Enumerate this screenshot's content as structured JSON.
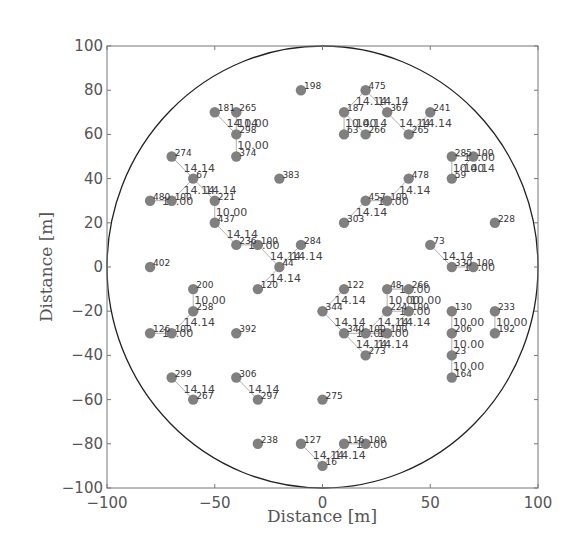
{
  "chart_data": {
    "type": "scatter",
    "title": "",
    "xlabel": "Distance [m]",
    "ylabel": "Distance [m]",
    "xlim": [
      -100,
      100
    ],
    "ylim": [
      -100,
      100
    ],
    "grid": false,
    "legend": null,
    "xticks": [
      -100,
      -50,
      0,
      50,
      100
    ],
    "yticks": [
      -100,
      -80,
      -60,
      -40,
      -20,
      0,
      20,
      40,
      60,
      80,
      100
    ],
    "xtick_labels": [
      "−100",
      "−50",
      "0",
      "50",
      "100"
    ],
    "ytick_labels": [
      "−100",
      "−80",
      "−60",
      "−40",
      "−20",
      "0",
      "20",
      "40",
      "60",
      "80",
      "100"
    ],
    "boundary_circle": {
      "cx": 0,
      "cy": 0,
      "r": 100
    },
    "colors": {
      "node": "#808080",
      "edge": "#9a9a9a",
      "circle": "#222222",
      "axes": "#777777"
    },
    "nodes": [
      {
        "x": -10,
        "y": 80,
        "label": "198"
      },
      {
        "x": 20,
        "y": 80,
        "label": "475"
      },
      {
        "x": -50,
        "y": 70,
        "label": "181"
      },
      {
        "x": -40,
        "y": 70,
        "label": "265"
      },
      {
        "x": -40,
        "y": 60,
        "label": "298"
      },
      {
        "x": -40,
        "y": 50,
        "label": "374"
      },
      {
        "x": 10,
        "y": 70,
        "label": "187"
      },
      {
        "x": 30,
        "y": 70,
        "label": "367"
      },
      {
        "x": 50,
        "y": 70,
        "label": "241"
      },
      {
        "x": 10,
        "y": 60,
        "label": "63"
      },
      {
        "x": 20,
        "y": 60,
        "label": "266"
      },
      {
        "x": 40,
        "y": 60,
        "label": "265"
      },
      {
        "x": -70,
        "y": 50,
        "label": "274"
      },
      {
        "x": -60,
        "y": 40,
        "label": "67"
      },
      {
        "x": -80,
        "y": 30,
        "label": "480"
      },
      {
        "x": -70,
        "y": 30,
        "label": "100"
      },
      {
        "x": -50,
        "y": 30,
        "label": "221"
      },
      {
        "x": -50,
        "y": 20,
        "label": "437"
      },
      {
        "x": -20,
        "y": 40,
        "label": "383"
      },
      {
        "x": 40,
        "y": 40,
        "label": "478"
      },
      {
        "x": 20,
        "y": 30,
        "label": "457"
      },
      {
        "x": 30,
        "y": 30,
        "label": "100"
      },
      {
        "x": 10,
        "y": 20,
        "label": "303"
      },
      {
        "x": 60,
        "y": 50,
        "label": "285"
      },
      {
        "x": 70,
        "y": 50,
        "label": "100"
      },
      {
        "x": 60,
        "y": 40,
        "label": "59"
      },
      {
        "x": 80,
        "y": 20,
        "label": "228"
      },
      {
        "x": -40,
        "y": 10,
        "label": "236"
      },
      {
        "x": -30,
        "y": 10,
        "label": "100"
      },
      {
        "x": -10,
        "y": 10,
        "label": "284"
      },
      {
        "x": -20,
        "y": 0,
        "label": "44"
      },
      {
        "x": -30,
        "y": -10,
        "label": "120"
      },
      {
        "x": -80,
        "y": 0,
        "label": "402"
      },
      {
        "x": 50,
        "y": 10,
        "label": "73"
      },
      {
        "x": 60,
        "y": 0,
        "label": "330"
      },
      {
        "x": 70,
        "y": 0,
        "label": "100"
      },
      {
        "x": -60,
        "y": -10,
        "label": "200"
      },
      {
        "x": -60,
        "y": -20,
        "label": "258"
      },
      {
        "x": -80,
        "y": -30,
        "label": "126"
      },
      {
        "x": -70,
        "y": -30,
        "label": "100"
      },
      {
        "x": -40,
        "y": -30,
        "label": "392"
      },
      {
        "x": 10,
        "y": -10,
        "label": "122"
      },
      {
        "x": 0,
        "y": -20,
        "label": "344"
      },
      {
        "x": 10,
        "y": -30,
        "label": "340"
      },
      {
        "x": 20,
        "y": -30,
        "label": "100"
      },
      {
        "x": 30,
        "y": -30,
        "label": "100"
      },
      {
        "x": 20,
        "y": -40,
        "label": "273"
      },
      {
        "x": 30,
        "y": -10,
        "label": "48"
      },
      {
        "x": 40,
        "y": -10,
        "label": "266"
      },
      {
        "x": 30,
        "y": -20,
        "label": "224"
      },
      {
        "x": 40,
        "y": -20,
        "label": "100"
      },
      {
        "x": 60,
        "y": -20,
        "label": "130"
      },
      {
        "x": 60,
        "y": -30,
        "label": "206"
      },
      {
        "x": 60,
        "y": -40,
        "label": "23"
      },
      {
        "x": 60,
        "y": -50,
        "label": "164"
      },
      {
        "x": 80,
        "y": -20,
        "label": "233"
      },
      {
        "x": 80,
        "y": -30,
        "label": "192"
      },
      {
        "x": -70,
        "y": -50,
        "label": "299"
      },
      {
        "x": -60,
        "y": -60,
        "label": "267"
      },
      {
        "x": -40,
        "y": -50,
        "label": "306"
      },
      {
        "x": -30,
        "y": -60,
        "label": "297"
      },
      {
        "x": 0,
        "y": -60,
        "label": "275"
      },
      {
        "x": -30,
        "y": -80,
        "label": "238"
      },
      {
        "x": -10,
        "y": -80,
        "label": "127"
      },
      {
        "x": 10,
        "y": -80,
        "label": "116"
      },
      {
        "x": 20,
        "y": -80,
        "label": "100"
      },
      {
        "x": 0,
        "y": -90,
        "label": "16"
      }
    ],
    "edges": [
      {
        "from": [
          -50,
          70
        ],
        "to": [
          -40,
          60
        ],
        "label": "14.14"
      },
      {
        "from": [
          -40,
          70
        ],
        "to": [
          -40,
          60
        ],
        "label": "10.00"
      },
      {
        "from": [
          -40,
          60
        ],
        "to": [
          -40,
          50
        ],
        "label": "10.00"
      },
      {
        "from": [
          20,
          80
        ],
        "to": [
          10,
          70
        ],
        "label": "14.14"
      },
      {
        "from": [
          20,
          80
        ],
        "to": [
          30,
          70
        ],
        "label": "14.14"
      },
      {
        "from": [
          10,
          70
        ],
        "to": [
          10,
          60
        ],
        "label": "10.00"
      },
      {
        "from": [
          10,
          70
        ],
        "to": [
          20,
          60
        ],
        "label": "14.14"
      },
      {
        "from": [
          30,
          70
        ],
        "to": [
          40,
          60
        ],
        "label": "14.14"
      },
      {
        "from": [
          50,
          70
        ],
        "to": [
          40,
          60
        ],
        "label": "14.14"
      },
      {
        "from": [
          -70,
          50
        ],
        "to": [
          -60,
          40
        ],
        "label": "14.14"
      },
      {
        "from": [
          -60,
          40
        ],
        "to": [
          -70,
          30
        ],
        "label": "14.14"
      },
      {
        "from": [
          -60,
          40
        ],
        "to": [
          -50,
          30
        ],
        "label": "14.14"
      },
      {
        "from": [
          -80,
          30
        ],
        "to": [
          -70,
          30
        ],
        "label": "10.00"
      },
      {
        "from": [
          -50,
          30
        ],
        "to": [
          -50,
          20
        ],
        "label": "10.00"
      },
      {
        "from": [
          -50,
          20
        ],
        "to": [
          -40,
          10
        ],
        "label": "14.14"
      },
      {
        "from": [
          -40,
          10
        ],
        "to": [
          -30,
          10
        ],
        "label": "10.00"
      },
      {
        "from": [
          -30,
          10
        ],
        "to": [
          -20,
          0
        ],
        "label": "14.14"
      },
      {
        "from": [
          -10,
          10
        ],
        "to": [
          -20,
          0
        ],
        "label": "14.14"
      },
      {
        "from": [
          -20,
          0
        ],
        "to": [
          -30,
          -10
        ],
        "label": "14.14"
      },
      {
        "from": [
          40,
          40
        ],
        "to": [
          30,
          30
        ],
        "label": "14.14"
      },
      {
        "from": [
          20,
          30
        ],
        "to": [
          30,
          30
        ],
        "label": "10.00"
      },
      {
        "from": [
          20,
          30
        ],
        "to": [
          10,
          20
        ],
        "label": "14.14"
      },
      {
        "from": [
          60,
          50
        ],
        "to": [
          70,
          50
        ],
        "label": "10.00"
      },
      {
        "from": [
          60,
          50
        ],
        "to": [
          60,
          40
        ],
        "label": "10.00"
      },
      {
        "from": [
          70,
          50
        ],
        "to": [
          60,
          40
        ],
        "label": "14.14"
      },
      {
        "from": [
          50,
          10
        ],
        "to": [
          60,
          0
        ],
        "label": "14.14"
      },
      {
        "from": [
          60,
          0
        ],
        "to": [
          70,
          0
        ],
        "label": "10.00"
      },
      {
        "from": [
          -60,
          -10
        ],
        "to": [
          -60,
          -20
        ],
        "label": "10.00"
      },
      {
        "from": [
          -60,
          -20
        ],
        "to": [
          -70,
          -30
        ],
        "label": "14.14"
      },
      {
        "from": [
          -80,
          -30
        ],
        "to": [
          -70,
          -30
        ],
        "label": "10.00"
      },
      {
        "from": [
          10,
          -10
        ],
        "to": [
          0,
          -20
        ],
        "label": "14.14"
      },
      {
        "from": [
          0,
          -20
        ],
        "to": [
          10,
          -30
        ],
        "label": "14.14"
      },
      {
        "from": [
          10,
          -30
        ],
        "to": [
          20,
          -40
        ],
        "label": "14.14"
      },
      {
        "from": [
          10,
          -30
        ],
        "to": [
          20,
          -30
        ],
        "label": "10.00"
      },
      {
        "from": [
          20,
          -30
        ],
        "to": [
          30,
          -30
        ],
        "label": "10.00"
      },
      {
        "from": [
          30,
          -20
        ],
        "to": [
          20,
          -30
        ],
        "label": "14.14"
      },
      {
        "from": [
          30,
          -10
        ],
        "to": [
          30,
          -20
        ],
        "label": "10.00"
      },
      {
        "from": [
          30,
          -10
        ],
        "to": [
          40,
          -10
        ],
        "label": "10.00"
      },
      {
        "from": [
          40,
          -10
        ],
        "to": [
          40,
          -20
        ],
        "label": "10.00"
      },
      {
        "from": [
          30,
          -20
        ],
        "to": [
          40,
          -20
        ],
        "label": "10.00"
      },
      {
        "from": [
          40,
          -20
        ],
        "to": [
          30,
          -30
        ],
        "label": "14.14"
      },
      {
        "from": [
          30,
          -30
        ],
        "to": [
          20,
          -40
        ],
        "label": "14.14"
      },
      {
        "from": [
          60,
          -20
        ],
        "to": [
          60,
          -30
        ],
        "label": "10.00"
      },
      {
        "from": [
          60,
          -30
        ],
        "to": [
          60,
          -40
        ],
        "label": "10.00"
      },
      {
        "from": [
          60,
          -40
        ],
        "to": [
          60,
          -50
        ],
        "label": "10.00"
      },
      {
        "from": [
          80,
          -20
        ],
        "to": [
          80,
          -30
        ],
        "label": "10.00"
      },
      {
        "from": [
          -70,
          -50
        ],
        "to": [
          -60,
          -60
        ],
        "label": "14.14"
      },
      {
        "from": [
          -40,
          -50
        ],
        "to": [
          -30,
          -60
        ],
        "label": "14.14"
      },
      {
        "from": [
          -10,
          -80
        ],
        "to": [
          0,
          -90
        ],
        "label": "14.14"
      },
      {
        "from": [
          10,
          -80
        ],
        "to": [
          0,
          -90
        ],
        "label": "14.14"
      },
      {
        "from": [
          10,
          -80
        ],
        "to": [
          20,
          -80
        ],
        "label": "10.00"
      }
    ]
  }
}
